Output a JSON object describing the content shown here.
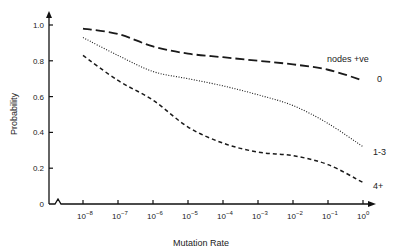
{
  "chart_data": {
    "type": "line",
    "title": "",
    "xlabel": "Mutation Rate",
    "ylabel": "Probability",
    "x_scale": "log",
    "x": [
      "10^-8",
      "10^-7",
      "10^-6",
      "10^-5",
      "10^-4",
      "10^-3",
      "10^-2",
      "10^-1",
      "10^0"
    ],
    "x_tick_labels": [
      {
        "base": "10",
        "exp": "-8"
      },
      {
        "base": "10",
        "exp": "-7"
      },
      {
        "base": "10",
        "exp": "-6"
      },
      {
        "base": "10",
        "exp": "-5"
      },
      {
        "base": "10",
        "exp": "-4"
      },
      {
        "base": "10",
        "exp": "-3"
      },
      {
        "base": "10",
        "exp": "-2"
      },
      {
        "base": "10",
        "exp": "-1"
      },
      {
        "base": "10",
        "exp": "0"
      }
    ],
    "y_ticks": [
      "0",
      "0.2",
      "0.4",
      "0.6",
      "0.8",
      "1.0"
    ],
    "ylim": [
      0,
      1.0
    ],
    "grid": false,
    "legend_title": "nodes +ve",
    "legend_position": "right, inline labels at line ends",
    "series": [
      {
        "name": "0",
        "style": "long-dash",
        "values": [
          0.98,
          0.95,
          0.88,
          0.84,
          0.82,
          0.8,
          0.78,
          0.75,
          0.69
        ]
      },
      {
        "name": "1-3",
        "style": "dotted",
        "values": [
          0.93,
          0.83,
          0.74,
          0.7,
          0.66,
          0.61,
          0.55,
          0.45,
          0.32
        ]
      },
      {
        "name": "4+",
        "style": "short-dash",
        "values": [
          0.83,
          0.69,
          0.58,
          0.43,
          0.34,
          0.29,
          0.27,
          0.22,
          0.12
        ]
      }
    ]
  }
}
